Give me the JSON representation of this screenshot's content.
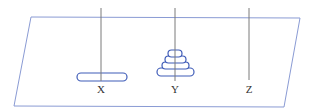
{
  "diagram": {
    "colors": {
      "plane": "#8a9bd4",
      "pole": "#7a7a7a",
      "disk": "#3f5cb8",
      "label": "#333333"
    },
    "plane": {
      "points": [
        [
          31,
          17
        ],
        [
          300,
          18
        ],
        [
          284,
          107
        ],
        [
          14,
          106
        ]
      ]
    },
    "pegs": [
      {
        "label": "X",
        "x": 101,
        "disks": [
          {
            "x1": 77,
            "x2": 127,
            "y": 73,
            "h": 8
          }
        ]
      },
      {
        "label": "Y",
        "x": 175,
        "disks": [
          {
            "x1": 157,
            "x2": 194,
            "y": 68,
            "h": 8
          },
          {
            "x1": 162,
            "x2": 189,
            "y": 62,
            "h": 7
          },
          {
            "x1": 165,
            "x2": 186,
            "y": 56,
            "h": 7
          },
          {
            "x1": 168,
            "x2": 182,
            "y": 50,
            "h": 7
          }
        ]
      },
      {
        "label": "Z",
        "x": 249,
        "disks": []
      }
    ]
  }
}
